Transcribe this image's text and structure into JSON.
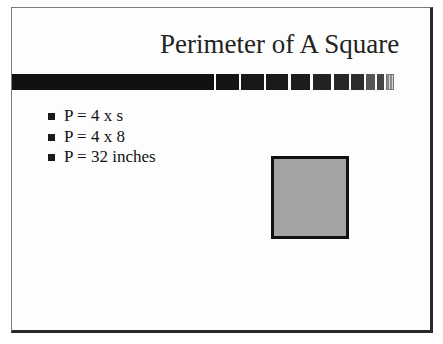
{
  "slide": {
    "title": "Perimeter of A Square",
    "bullets": [
      "P = 4 x s",
      "P = 4 x 8",
      "P = 32 inches"
    ],
    "colors": {
      "title_text": "#222222",
      "bar": "#111111",
      "square_fill": "#a3a3a3",
      "square_border": "#111111"
    }
  }
}
